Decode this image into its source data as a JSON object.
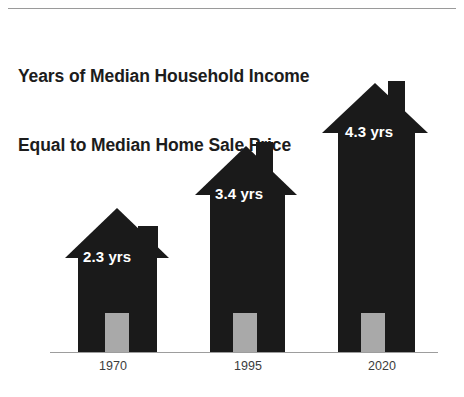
{
  "chart_data": {
    "type": "bar",
    "title": "Years of Median Household Income Equal to Median Home Sale Price",
    "title_lines": [
      "Years of Median Household Income",
      "Equal to Median Home Sale Price"
    ],
    "categories": [
      "1970",
      "1995",
      "2020"
    ],
    "values": [
      2.3,
      3.4,
      4.3
    ],
    "value_labels": [
      "2.3 yrs",
      "3.4 yrs",
      "4.3 yrs"
    ],
    "unit": "yrs",
    "xlabel": "",
    "ylabel": "",
    "ylim": [
      0,
      4.3
    ],
    "grid": false,
    "legend": null,
    "marker_style": "house-pictogram",
    "colors": {
      "house": "#1a1a1a",
      "door": "#a9a9a9",
      "label_text": "#ffffff",
      "title_text": "#1c1c1c",
      "axis_line": "#9d9d9d",
      "top_rule": "#9a9a9a",
      "background": "#ffffff"
    }
  },
  "houses": [
    {
      "name": "house-1970",
      "year": "1970",
      "value_label": "2.3 yrs",
      "geometry": {
        "body_left": 78,
        "body_width": 79,
        "body_height": 94,
        "roof_left": 65,
        "roof_width": 105,
        "roof_height": 50,
        "roof_bottom_offset": 94,
        "chimney_left": 138,
        "chimney_width": 20,
        "chimney_height": 32,
        "chimney_bottom_offset": 94,
        "door_left": 105,
        "door_width": 24,
        "door_height": 39,
        "label_left": 83,
        "label_bottom": 87
      }
    },
    {
      "name": "house-1995",
      "year": "1995",
      "value_label": "3.4 yrs",
      "geometry": {
        "body_left": 210,
        "body_width": 75,
        "body_height": 157,
        "roof_left": 195,
        "roof_width": 103,
        "roof_height": 49,
        "roof_bottom_offset": 157,
        "chimney_left": 256,
        "chimney_width": 17,
        "chimney_height": 53,
        "chimney_bottom_offset": 157,
        "door_left": 233,
        "door_width": 24,
        "door_height": 39,
        "label_left": 215,
        "label_bottom": 150
      }
    },
    {
      "name": "house-2020",
      "year": "2020",
      "value_label": "4.3 yrs",
      "geometry": {
        "body_left": 338,
        "body_width": 77,
        "body_height": 219,
        "roof_left": 322,
        "roof_width": 106,
        "roof_height": 50,
        "roof_bottom_offset": 219,
        "chimney_left": 388,
        "chimney_width": 17,
        "chimney_height": 52,
        "chimney_bottom_offset": 219,
        "door_left": 361,
        "door_width": 24,
        "door_height": 39,
        "label_left": 345,
        "label_bottom": 212
      }
    }
  ],
  "year_axis": [
    {
      "label": "1970",
      "center": 113
    },
    {
      "label": "1995",
      "center": 248
    },
    {
      "label": "2020",
      "center": 382
    }
  ]
}
